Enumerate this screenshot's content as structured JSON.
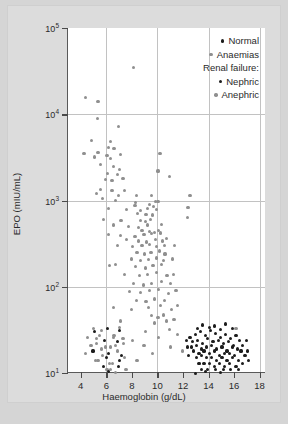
{
  "chart_data": {
    "type": "scatter",
    "title": "",
    "xlabel": "Haemoglobin (g/dL)",
    "ylabel": "EPO (mIU/mL)",
    "xlim": [
      3.0,
      18.5
    ],
    "ylim_log10": [
      1.0,
      5.0
    ],
    "xscale": "linear",
    "yscale": "log",
    "xticks": [
      4,
      6,
      8,
      10,
      12,
      14,
      16,
      18
    ],
    "xtick_labels": [
      "4",
      "6",
      "8",
      "10",
      "12",
      "14",
      "16",
      "18"
    ],
    "yticks_log10": [
      1,
      2,
      3,
      4,
      5
    ],
    "ytick_labels": [
      "10¹",
      "10²",
      "10³",
      "10⁴",
      "10⁵"
    ],
    "ytick_mantissa": [
      "10",
      "10",
      "10",
      "10",
      "10"
    ],
    "ytick_exponent": [
      "1",
      "2",
      "3",
      "4",
      "5"
    ],
    "grid": {
      "vertical_at_x": [
        6,
        10,
        14,
        18
      ],
      "horizontal_at_log10": [
        2,
        3,
        4
      ],
      "color": "#c2c2c2"
    },
    "legend": {
      "position": "top-right-inside",
      "entries": [
        {
          "label": "Normal",
          "marker": "circle",
          "color": "#1c1c1c",
          "kind": "item"
        },
        {
          "label": "Anaemias",
          "marker": "circle",
          "color": "#8f8f8f",
          "kind": "item"
        },
        {
          "label": "Renal failure:",
          "marker": "none",
          "color": "",
          "kind": "header"
        },
        {
          "label": "Nephric",
          "marker": "circle",
          "color": "#1c1c1c",
          "kind": "item"
        },
        {
          "label": "Anephric",
          "marker": "circle",
          "color": "#8f8f8f",
          "kind": "item"
        }
      ]
    },
    "series": [
      {
        "name": "Anaemias",
        "color": "#8f8f8f",
        "points": [
          [
            8.15,
            35000
          ],
          [
            4.35,
            15500
          ],
          [
            5.35,
            14000
          ],
          [
            5.3,
            9000
          ],
          [
            6.95,
            7200
          ],
          [
            4.85,
            5000
          ],
          [
            6.35,
            4800
          ],
          [
            6.2,
            4100
          ],
          [
            4.25,
            3500
          ],
          [
            5.35,
            3600
          ],
          [
            6.6,
            4000
          ],
          [
            6.05,
            3300
          ],
          [
            5.1,
            3200
          ],
          [
            6.3,
            3100
          ],
          [
            7.1,
            3400
          ],
          [
            10.2,
            3500
          ],
          [
            5.55,
            2600
          ],
          [
            6.55,
            2500
          ],
          [
            7.05,
            2300
          ],
          [
            10.05,
            2200
          ],
          [
            6.1,
            2050
          ],
          [
            6.85,
            2000
          ],
          [
            10.95,
            1900
          ],
          [
            5.95,
            1750
          ],
          [
            6.45,
            1700
          ],
          [
            7.3,
            1800
          ],
          [
            5.55,
            1350
          ],
          [
            6.45,
            1300
          ],
          [
            7.4,
            1300
          ],
          [
            5.25,
            1200
          ],
          [
            6.95,
            1150
          ],
          [
            8.35,
            1150
          ],
          [
            9.55,
            1150
          ],
          [
            12.55,
            1150
          ],
          [
            5.7,
            1050
          ],
          [
            6.7,
            1000
          ],
          [
            8.3,
            950
          ],
          [
            9.35,
            900
          ],
          [
            9.85,
            980
          ],
          [
            8.25,
            880
          ],
          [
            9.7,
            850
          ],
          [
            10.05,
            980
          ],
          [
            12.4,
            830
          ],
          [
            6.2,
            800
          ],
          [
            7.55,
            780
          ],
          [
            8.7,
            760
          ],
          [
            9.2,
            800
          ],
          [
            9.95,
            790
          ],
          [
            8.45,
            700
          ],
          [
            9.1,
            690
          ],
          [
            9.6,
            680
          ],
          [
            12.35,
            640
          ],
          [
            5.8,
            600
          ],
          [
            7.15,
            590
          ],
          [
            8.65,
            580
          ],
          [
            9.05,
            570
          ],
          [
            9.45,
            600
          ],
          [
            6.55,
            520
          ],
          [
            7.75,
            500
          ],
          [
            8.55,
            490
          ],
          [
            9.25,
            520
          ],
          [
            10.35,
            530
          ],
          [
            8.8,
            450
          ],
          [
            9.35,
            440
          ],
          [
            9.75,
            430
          ],
          [
            10.1,
            450
          ],
          [
            6.2,
            400
          ],
          [
            7.1,
            390
          ],
          [
            8.25,
            380
          ],
          [
            8.95,
            400
          ],
          [
            9.55,
            410
          ],
          [
            10.25,
            420
          ],
          [
            7.6,
            350
          ],
          [
            8.55,
            340
          ],
          [
            9.15,
            330
          ],
          [
            9.85,
            350
          ],
          [
            10.4,
            340
          ],
          [
            10.7,
            360
          ],
          [
            6.85,
            300
          ],
          [
            8.05,
            290
          ],
          [
            8.8,
            300
          ],
          [
            9.35,
            310
          ],
          [
            9.95,
            290
          ],
          [
            10.55,
            300
          ],
          [
            11.35,
            300
          ],
          [
            8.4,
            250
          ],
          [
            9.0,
            240
          ],
          [
            9.5,
            250
          ],
          [
            10.15,
            260
          ],
          [
            10.6,
            240
          ],
          [
            7.95,
            210
          ],
          [
            8.7,
            200
          ],
          [
            9.3,
            205
          ],
          [
            9.9,
            215
          ],
          [
            10.45,
            200
          ],
          [
            11.15,
            210
          ],
          [
            6.25,
            175
          ],
          [
            6.7,
            180
          ],
          [
            8.3,
            170
          ],
          [
            9.05,
            165
          ],
          [
            9.65,
            175
          ],
          [
            10.3,
            180
          ],
          [
            7.45,
            140
          ],
          [
            8.6,
            135
          ],
          [
            9.25,
            140
          ],
          [
            9.95,
            145
          ],
          [
            10.75,
            135
          ],
          [
            11.25,
            140
          ],
          [
            8.15,
            110
          ],
          [
            8.9,
            105
          ],
          [
            9.55,
            110
          ],
          [
            10.35,
            115
          ],
          [
            11.05,
            108
          ],
          [
            7.8,
            88
          ],
          [
            8.7,
            85
          ],
          [
            9.4,
            90
          ],
          [
            10.1,
            92
          ],
          [
            10.85,
            84
          ],
          [
            11.45,
            90
          ],
          [
            8.35,
            70
          ],
          [
            9.1,
            68
          ],
          [
            9.8,
            72
          ],
          [
            10.55,
            70
          ],
          [
            6.55,
            58
          ],
          [
            8.0,
            55
          ],
          [
            9.3,
            57
          ],
          [
            10.25,
            60
          ],
          [
            11.1,
            55
          ],
          [
            11.55,
            60
          ],
          [
            9.55,
            46
          ],
          [
            10.05,
            44
          ],
          [
            10.45,
            47
          ],
          [
            7.1,
            40
          ],
          [
            9.8,
            38
          ],
          [
            10.7,
            40
          ],
          [
            11.3,
            42
          ],
          [
            5.0,
            33
          ],
          [
            5.6,
            31
          ],
          [
            7.05,
            34
          ],
          [
            9.05,
            30
          ],
          [
            10.95,
            32
          ],
          [
            16.15,
            33
          ],
          [
            4.55,
            26
          ],
          [
            5.25,
            25
          ],
          [
            6.6,
            27
          ],
          [
            8.05,
            24
          ],
          [
            10.1,
            26
          ],
          [
            11.6,
            28
          ],
          [
            4.8,
            21
          ],
          [
            5.95,
            20
          ],
          [
            7.35,
            22
          ],
          [
            8.95,
            21
          ],
          [
            11.05,
            20
          ],
          [
            4.4,
            17
          ],
          [
            5.7,
            16
          ],
          [
            6.9,
            18
          ],
          [
            9.6,
            17
          ],
          [
            11.95,
            18
          ],
          [
            5.15,
            14
          ],
          [
            6.25,
            13
          ],
          [
            8.4,
            14
          ],
          [
            13.3,
            13
          ],
          [
            6.05,
            11
          ],
          [
            7.5,
            11
          ]
        ]
      },
      {
        "name": "Renal failure (nephric / anephric)",
        "color": "mixed",
        "points": [
          [
            5.05,
            30
          ],
          [
            5.45,
            27
          ],
          [
            6.1,
            33
          ],
          [
            6.55,
            26
          ],
          [
            7.05,
            31
          ],
          [
            5.25,
            22
          ],
          [
            5.85,
            24
          ],
          [
            6.35,
            20
          ],
          [
            6.85,
            23
          ],
          [
            7.3,
            25
          ],
          [
            4.95,
            18
          ],
          [
            5.6,
            19
          ],
          [
            6.2,
            17
          ],
          [
            6.7,
            21
          ],
          [
            7.2,
            16
          ],
          [
            5.35,
            14
          ],
          [
            6.0,
            15
          ],
          [
            6.5,
            13
          ],
          [
            7.0,
            14
          ],
          [
            7.45,
            15
          ],
          [
            5.75,
            12
          ],
          [
            6.3,
            11
          ],
          [
            6.95,
            12
          ],
          [
            7.55,
            11
          ],
          [
            6.15,
            10.5
          ],
          [
            6.75,
            10.2
          ]
        ]
      },
      {
        "name": "Normal",
        "color": "#1c1c1c",
        "points": [
          [
            12.55,
            26
          ],
          [
            12.95,
            28
          ],
          [
            13.35,
            30
          ],
          [
            13.75,
            27
          ],
          [
            14.15,
            31
          ],
          [
            14.55,
            29
          ],
          [
            14.95,
            26
          ],
          [
            15.35,
            28
          ],
          [
            15.75,
            25
          ],
          [
            16.15,
            27
          ],
          [
            12.75,
            23
          ],
          [
            13.15,
            24
          ],
          [
            13.55,
            22
          ],
          [
            13.95,
            25
          ],
          [
            14.35,
            23
          ],
          [
            14.75,
            24
          ],
          [
            15.15,
            22
          ],
          [
            15.55,
            23
          ],
          [
            15.95,
            21
          ],
          [
            16.45,
            24
          ],
          [
            12.65,
            20
          ],
          [
            13.05,
            21
          ],
          [
            13.45,
            19
          ],
          [
            13.85,
            20
          ],
          [
            14.25,
            21
          ],
          [
            14.65,
            19
          ],
          [
            15.05,
            20
          ],
          [
            15.45,
            18
          ],
          [
            15.85,
            20
          ],
          [
            16.25,
            19
          ],
          [
            16.65,
            21
          ],
          [
            12.85,
            18
          ],
          [
            13.25,
            17
          ],
          [
            13.65,
            18
          ],
          [
            14.05,
            17
          ],
          [
            14.45,
            18
          ],
          [
            14.85,
            16
          ],
          [
            15.25,
            17
          ],
          [
            15.65,
            17
          ],
          [
            16.05,
            16
          ],
          [
            16.55,
            18
          ],
          [
            13.05,
            15
          ],
          [
            13.45,
            16
          ],
          [
            13.85,
            15
          ],
          [
            14.25,
            15
          ],
          [
            14.65,
            14
          ],
          [
            15.05,
            15
          ],
          [
            15.45,
            14
          ],
          [
            15.85,
            15
          ],
          [
            16.35,
            14
          ],
          [
            16.85,
            16
          ],
          [
            13.25,
            13
          ],
          [
            13.65,
            13
          ],
          [
            14.05,
            13
          ],
          [
            14.45,
            12
          ],
          [
            14.85,
            13
          ],
          [
            15.25,
            12
          ],
          [
            15.65,
            13
          ],
          [
            16.15,
            12
          ],
          [
            16.65,
            13
          ],
          [
            13.45,
            11
          ],
          [
            13.95,
            11
          ],
          [
            14.55,
            11
          ],
          [
            15.15,
            11
          ],
          [
            15.75,
            11
          ],
          [
            16.35,
            11
          ],
          [
            12.45,
            16
          ],
          [
            12.35,
            20
          ],
          [
            17.05,
            18
          ],
          [
            17.15,
            14
          ],
          [
            13.15,
            33
          ],
          [
            14.05,
            34
          ],
          [
            14.95,
            32
          ],
          [
            15.85,
            33
          ],
          [
            16.95,
            24
          ],
          [
            13.55,
            36
          ],
          [
            14.45,
            35
          ],
          [
            15.35,
            37
          ],
          [
            12.25,
            24
          ],
          [
            13.75,
            10.5
          ],
          [
            14.95,
            10.2
          ],
          [
            12.95,
            9.8
          ]
        ]
      }
    ]
  }
}
